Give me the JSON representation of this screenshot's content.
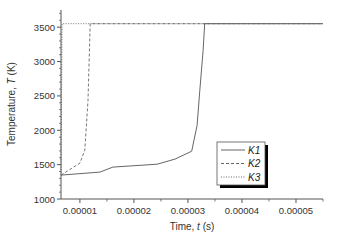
{
  "chart_data": {
    "type": "line",
    "title": "",
    "xlabel": "Time, t (s)",
    "xlabel_parts": {
      "prefix": "Time, ",
      "var": "t",
      "suffix": " (s)"
    },
    "ylabel": "Temperature, T (K)",
    "ylabel_parts": {
      "prefix": "Temperature, ",
      "var": "T",
      "suffix": " (K)"
    },
    "xlim": [
      6.5e-06,
      5.5e-05
    ],
    "ylim": [
      1000,
      3750
    ],
    "x_ticks": [
      1e-05,
      2e-05,
      3e-05,
      4e-05,
      5e-05
    ],
    "x_tick_labels": [
      "0.00001",
      "0.00002",
      "0.00003",
      "0.00004",
      "0.00005"
    ],
    "y_ticks": [
      1000,
      1500,
      2000,
      2500,
      3000,
      3500
    ],
    "y_tick_labels": [
      "1000",
      "1500",
      "2000",
      "2500",
      "3000",
      "3500"
    ],
    "grid": false,
    "legend_position": "lower right (inside)",
    "series": [
      {
        "name": "K1",
        "style": "solid",
        "x": [
          6.5e-06,
          1.37e-05,
          1.61e-05,
          2.43e-05,
          2.76e-05,
          3.07e-05,
          3.17e-05,
          3.22e-05,
          3.28e-05,
          3.31e-05,
          5.5e-05
        ],
        "y": [
          1348,
          1391,
          1464,
          1507,
          1580,
          1696,
          2072,
          2580,
          3159,
          3551,
          3551
        ]
      },
      {
        "name": "K2",
        "style": "dashed",
        "x": [
          6.5e-06,
          1e-05,
          1.09e-05,
          1.15e-05,
          1.19e-05,
          5.5e-05
        ],
        "y": [
          1348,
          1522,
          1710,
          2435,
          3551,
          3551
        ]
      },
      {
        "name": "K3",
        "style": "dotted",
        "x": [
          6.5e-06,
          6.7e-06,
          5.5e-05
        ],
        "y": [
          1348,
          3551,
          3551
        ]
      }
    ],
    "colors": {
      "axis": "#555555",
      "line": "#666666",
      "text": "#333333",
      "legend_shadow": "#000000"
    }
  }
}
